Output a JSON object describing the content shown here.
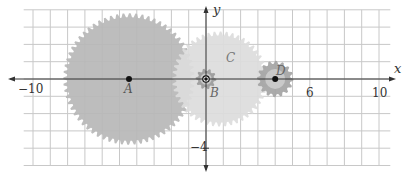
{
  "diagram": {
    "type": "coordinate-plane-gears",
    "origin_px": [
      206,
      79
    ],
    "unit_px": 17.3,
    "axes": {
      "x_label": "x",
      "y_label": "y",
      "x_ticks": [
        {
          "value": -10,
          "label": "−10"
        },
        {
          "value": 6,
          "label": "6"
        },
        {
          "value": 10,
          "label": "10"
        }
      ],
      "y_ticks": [
        {
          "value": -4,
          "label": "−4"
        }
      ]
    },
    "grid": {
      "x_min": -11,
      "x_max": 11,
      "y_min": -5,
      "y_max": 4,
      "step": 1,
      "color": "#c8c8c8"
    },
    "gears": [
      {
        "id": "A",
        "label": "A",
        "center": [
          -4.45,
          0
        ],
        "radius": 3.8,
        "teeth": 64,
        "fill": "#b7b7b7",
        "tooth_color": "#a9a9a9"
      },
      {
        "id": "C",
        "label": "C",
        "center": [
          0.8,
          0.0
        ],
        "radius": 2.75,
        "teeth": 48,
        "fill": "#dcdcdc",
        "tooth_color": "#d0d0d0"
      },
      {
        "id": "B",
        "label": "B",
        "center": [
          0,
          0
        ],
        "radius": 0.6,
        "teeth": 10,
        "fill": "#9a9a9a",
        "tooth_color": "#8a8a8a"
      },
      {
        "id": "D",
        "label": "D",
        "center": [
          4.0,
          0
        ],
        "radius": 1.05,
        "teeth": 16,
        "fill": "#a4a4a4",
        "tooth_color": "#9a9a9a"
      }
    ]
  },
  "labels": {
    "x_axis": "x",
    "y_axis": "y",
    "tick_neg10": "−10",
    "tick_6": "6",
    "tick_10": "10",
    "tick_neg4": "−4",
    "gear_a": "A",
    "gear_b": "B",
    "gear_c": "C",
    "gear_d": "D"
  }
}
